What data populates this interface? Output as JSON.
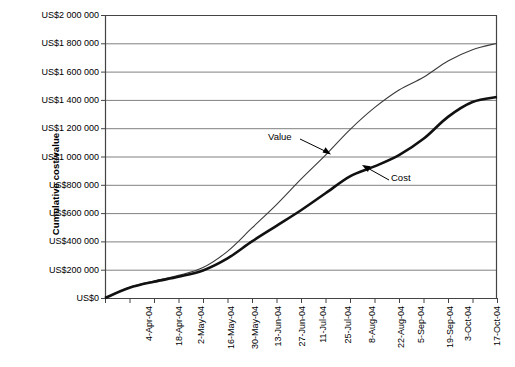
{
  "chart_data": {
    "type": "line",
    "title": "",
    "xlabel": "",
    "ylabel": "Cumulative cost/value",
    "ylim": [
      0,
      2000000
    ],
    "grid": true,
    "grid_axis": "y",
    "legend_position": "inline-annotations",
    "y_ticks": [
      "US$0",
      "US$200 000",
      "US$400 000",
      "US$600 000",
      "US$800 000",
      "US$1 000 000",
      "US$1 200 000",
      "US$1 400 000",
      "US$1 600 000",
      "US$1 800 000",
      "US$2 000 000"
    ],
    "y_tick_values": [
      0,
      200000,
      400000,
      600000,
      800000,
      1000000,
      1200000,
      1400000,
      1600000,
      1800000,
      2000000
    ],
    "categories": [
      "4-Apr-04",
      "18-Apr-04",
      "2-May-04",
      "16-May-04",
      "30-May-04",
      "13-Jun-04",
      "27-Jun-04",
      "11-Jul-04",
      "25-Jul-04",
      "8-Aug-04",
      "22-Aug-04",
      "5-Sep-04",
      "19-Sep-04",
      "3-Oct-04",
      "17-Oct-04",
      "31-Oct-04",
      "14-Nov-04"
    ],
    "series": [
      {
        "name": "Value",
        "style": "thin",
        "color": "#3a3a3a",
        "values": [
          0,
          75000,
          120000,
          160000,
          215000,
          330000,
          495000,
          660000,
          840000,
          1010000,
          1190000,
          1345000,
          1470000,
          1560000,
          1675000,
          1755000,
          1800000
        ]
      },
      {
        "name": "Cost",
        "style": "thick",
        "color": "#111111",
        "values": [
          0,
          72000,
          115000,
          150000,
          195000,
          280000,
          400000,
          510000,
          620000,
          740000,
          860000,
          930000,
          1010000,
          1125000,
          1280000,
          1385000,
          1420000
        ]
      }
    ],
    "annotations": [
      {
        "label": "Value",
        "points_to": "value-series"
      },
      {
        "label": "Cost",
        "points_to": "cost-series"
      }
    ]
  }
}
